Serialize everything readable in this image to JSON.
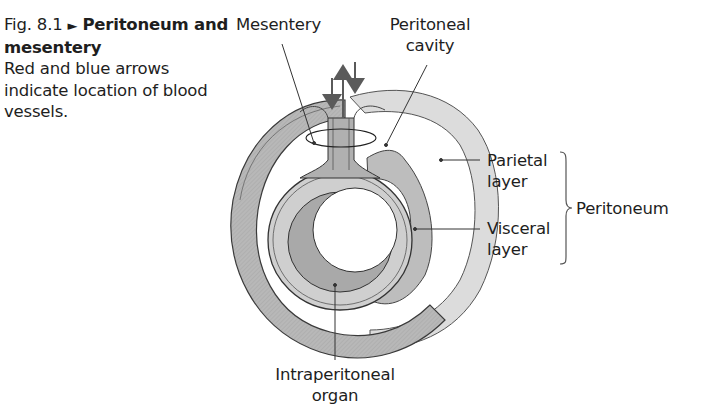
{
  "caption": {
    "figure_number": "Fig. 8.1",
    "marker": "►",
    "title": "Peritoneum and mesentery",
    "description": "Red and blue arrows indicate location of blood vessels."
  },
  "labels": {
    "mesentery": "Mesentery",
    "peritoneal_cavity_line1": "Peritoneal",
    "peritoneal_cavity_line2": "cavity",
    "parietal_line1": "Parietal",
    "parietal_line2": "layer",
    "visceral_line1": "Visceral",
    "visceral_line2": "layer",
    "peritoneum": "Peritoneum",
    "organ_line1": "Intraperitoneal",
    "organ_line2": "organ"
  },
  "colors": {
    "parietal_fill": "#d9d9d9",
    "visceral_fill": "#c4c4c4",
    "dark_fill": "#9a9a9a",
    "outline": "#3a3a3a",
    "arrow": "#5a5a5a",
    "text": "#1e1e1e"
  }
}
